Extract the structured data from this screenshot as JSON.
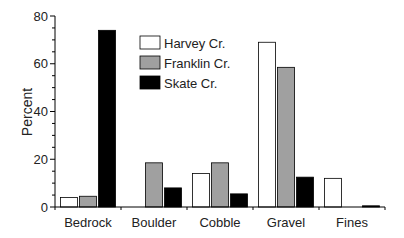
{
  "chart_data": {
    "type": "bar",
    "title": "",
    "xlabel": "",
    "ylabel": "Percent",
    "ylim": [
      0,
      80
    ],
    "yticks": [
      0,
      20,
      40,
      60,
      80
    ],
    "y_minor_step": 5,
    "grid": false,
    "legend_position": "top-center",
    "categories": [
      "Bedrock",
      "Boulder",
      "Cobble",
      "Gravel",
      "Fines"
    ],
    "series": [
      {
        "name": "Harvey Cr.",
        "color": "#ffffff",
        "values": [
          4,
          0,
          14,
          69,
          12
        ]
      },
      {
        "name": "Franklin Cr.",
        "color": "#a0a0a0",
        "values": [
          4.5,
          18.5,
          18.5,
          58.5,
          0
        ]
      },
      {
        "name": "Skate Cr.",
        "color": "#000000",
        "values": [
          74,
          8,
          5.5,
          12.5,
          0.5
        ]
      }
    ]
  }
}
